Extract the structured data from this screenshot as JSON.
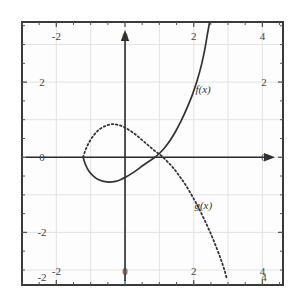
{
  "chart_data": {
    "type": "line",
    "title": "",
    "xlabel": "",
    "ylabel": "",
    "xlim": [
      -3,
      4.6
    ],
    "ylim": [
      -3.4,
      3.6
    ],
    "grid": true,
    "legend_position": "inline-annotation",
    "axes": {
      "x_axis_value": 0,
      "y_axis_value": 0,
      "x_axis_arrow": "right",
      "y_axis_arrow": "up"
    },
    "ticks": {
      "top": [
        "-2",
        "0",
        "2",
        "4"
      ],
      "bottom": [
        "-2",
        "0",
        "2",
        "4"
      ],
      "left": [
        "2",
        "0",
        "-2",
        "-2"
      ],
      "right": [
        "2",
        "0",
        "4"
      ],
      "top_values": [
        -2,
        0,
        2,
        4
      ],
      "bottom_values": [
        -2,
        0,
        2,
        4
      ],
      "left_values": [
        2,
        0,
        -2,
        -3.2
      ],
      "right_values": [
        2,
        0,
        -3.2
      ],
      "minor_step": 0.5
    },
    "series": [
      {
        "name": "f(x)",
        "label": "f(x)",
        "style": "solid",
        "color": "#333333",
        "label_x": 2.05,
        "label_y": 1.72,
        "points": [
          [
            -1.22,
            0.0
          ],
          [
            -1.15,
            -0.2
          ],
          [
            -1.05,
            -0.37
          ],
          [
            -0.92,
            -0.5
          ],
          [
            -0.78,
            -0.59
          ],
          [
            -0.62,
            -0.64
          ],
          [
            -0.45,
            -0.66
          ],
          [
            -0.28,
            -0.64
          ],
          [
            -0.12,
            -0.59
          ],
          [
            0.04,
            -0.52
          ],
          [
            0.2,
            -0.43
          ],
          [
            0.36,
            -0.33
          ],
          [
            0.52,
            -0.22
          ],
          [
            0.68,
            -0.12
          ],
          [
            0.84,
            -0.02
          ],
          [
            1.0,
            0.1
          ],
          [
            1.16,
            0.26
          ],
          [
            1.32,
            0.46
          ],
          [
            1.48,
            0.7
          ],
          [
            1.64,
            0.98
          ],
          [
            1.8,
            1.3
          ],
          [
            1.96,
            1.66
          ],
          [
            2.1,
            2.04
          ],
          [
            2.22,
            2.44
          ],
          [
            2.32,
            2.86
          ],
          [
            2.4,
            3.28
          ],
          [
            2.46,
            3.58
          ]
        ]
      },
      {
        "name": "g(x)",
        "label": "g(x)",
        "style": "dotted",
        "color": "#333333",
        "label_x": 2.02,
        "label_y": -1.38,
        "points": [
          [
            -1.22,
            0.0
          ],
          [
            -1.14,
            0.22
          ],
          [
            -1.02,
            0.44
          ],
          [
            -0.88,
            0.62
          ],
          [
            -0.72,
            0.76
          ],
          [
            -0.55,
            0.84
          ],
          [
            -0.38,
            0.88
          ],
          [
            -0.2,
            0.86
          ],
          [
            -0.02,
            0.8
          ],
          [
            0.16,
            0.7
          ],
          [
            0.34,
            0.58
          ],
          [
            0.52,
            0.44
          ],
          [
            0.7,
            0.3
          ],
          [
            0.88,
            0.16
          ],
          [
            1.06,
            0.04
          ],
          [
            1.24,
            -0.12
          ],
          [
            1.42,
            -0.3
          ],
          [
            1.6,
            -0.52
          ],
          [
            1.78,
            -0.76
          ],
          [
            1.96,
            -1.04
          ],
          [
            2.14,
            -1.34
          ],
          [
            2.32,
            -1.68
          ],
          [
            2.5,
            -2.04
          ],
          [
            2.66,
            -2.4
          ],
          [
            2.8,
            -2.74
          ],
          [
            2.9,
            -3.02
          ],
          [
            2.96,
            -3.22
          ]
        ]
      }
    ],
    "intersections": [
      {
        "x": -1.22,
        "y": 0.0
      },
      {
        "x": 1.18,
        "y": 0.0
      }
    ]
  },
  "style": {
    "frame_color": "#3a3a3a",
    "grid_color": "#e2e2e2",
    "axis_color": "#2b2b2b",
    "tick_color": "#555555",
    "label_color": "#444444",
    "curve_color": "#333333",
    "background": "#ffffff",
    "plot_background": "#fdfdfd"
  }
}
